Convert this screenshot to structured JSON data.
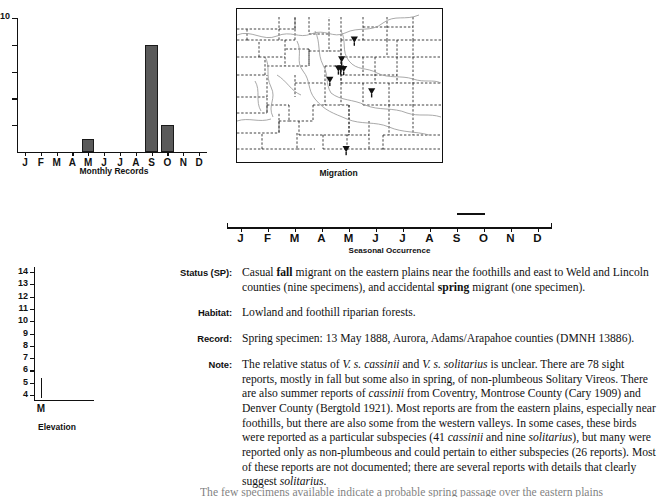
{
  "chart_data": [
    {
      "type": "bar",
      "name": "monthly-records",
      "title": "Monthly Records",
      "categories": [
        "J",
        "F",
        "M",
        "A",
        "M",
        "J",
        "J",
        "A",
        "S",
        "O",
        "N",
        "D"
      ],
      "values": [
        0,
        0,
        0,
        0,
        1,
        0,
        0,
        0,
        8,
        2,
        0,
        0
      ],
      "xlabel": "Monthly Records",
      "ylabel": "",
      "ylim": [
        0,
        10
      ],
      "ytick_labels": [
        "10"
      ],
      "ytick_values": [
        10,
        8,
        6,
        4,
        2
      ],
      "grid": false,
      "bar_color": "#5a5a5a",
      "bar_edge_color": "#1a1a1a"
    },
    {
      "type": "bar",
      "name": "seasonal-occurrence",
      "title": "Seasonal Occurrence",
      "categories": [
        "J",
        "F",
        "M",
        "A",
        "M",
        "J",
        "J",
        "A",
        "S",
        "O",
        "N",
        "D"
      ],
      "xlabel": "Seasonal Occurrence",
      "occurrence_spans": [
        {
          "start_month": 8.5,
          "end_month": 9.55,
          "label": "late Aug - late Sep"
        }
      ],
      "ylim": [
        0,
        1
      ],
      "grid": false
    },
    {
      "type": "bar",
      "name": "elevation",
      "title": "Elevation",
      "categories": [
        "M"
      ],
      "xlabel": "Elevation",
      "ylabel": "",
      "ylim": [
        3.6,
        14.4
      ],
      "ytick_labels": [
        "14",
        "13",
        "12",
        "11",
        "10",
        "9",
        "8",
        "7",
        "6",
        "5",
        "4"
      ],
      "ranges": [
        {
          "category": "M",
          "low": 3.75,
          "high": 5.35
        }
      ],
      "grid": false
    }
  ],
  "monthly_chart": {
    "caption": "Monthly Records",
    "y_top_label": "10"
  },
  "map": {
    "caption": "Migration",
    "marker_icon": "inverted-triangle-marker",
    "markers": [
      {
        "x": 0.575,
        "y": 0.205
      },
      {
        "x": 0.513,
        "y": 0.335
      },
      {
        "x": 0.497,
        "y": 0.395
      },
      {
        "x": 0.508,
        "y": 0.395
      },
      {
        "x": 0.523,
        "y": 0.398
      },
      {
        "x": 0.455,
        "y": 0.47
      },
      {
        "x": 0.66,
        "y": 0.545
      },
      {
        "x": 0.535,
        "y": 0.925
      }
    ]
  },
  "seasonal": {
    "caption": "Seasonal Occurrence",
    "months": [
      "J",
      "F",
      "M",
      "A",
      "M",
      "J",
      "J",
      "A",
      "S",
      "O",
      "N",
      "D"
    ]
  },
  "elevation": {
    "caption": "Elevation",
    "x_label": "M",
    "tick_labels": [
      "14",
      "13",
      "12",
      "11",
      "10",
      "9",
      "8",
      "7",
      "6",
      "5",
      "4"
    ]
  },
  "account": {
    "fields": [
      {
        "label": "Status (SP):",
        "html": "Casual <b>fall</b> migrant on the eastern plains near the foothills and east to Weld and Lincoln counties (nine specimens), and accidental <b>spring</b> migrant (one specimen)."
      },
      {
        "label": "Habitat:",
        "html": "Lowland and foothill riparian forests."
      },
      {
        "label": "Record:",
        "html": "Spring specimen: 13 May 1888, Aurora, Adams/Arapahoe counties (DMNH 13886)."
      },
      {
        "label": "Note:",
        "html": "The relative status of <i>V. s. cassinii</i> and <i>V. s. solitarius</i> is unclear. There are 78 sight reports, mostly in fall but some also in spring, of non-plumbeous Solitary Vireos. There are also summer reports of <i>cassinii</i> from Coventry, Montrose County (Cary 1909) and Denver County (Bergtold 1921). Most reports are from the eastern plains, especially near foothills, but there are also some from the western valleys. In some cases, these birds were reported as a particular subspecies (41 <i>cassinii</i> and nine <i>solitarius</i>), but many were reported only as non-plumbeous and could pertain to either subspecies (26 reports). Most of these reports are not documented; there are several reports with details that clearly suggest <i>solitarius</i>."
      }
    ],
    "trailing_line": "The few specimens available indicate a probable spring passage over the eastern plains"
  }
}
